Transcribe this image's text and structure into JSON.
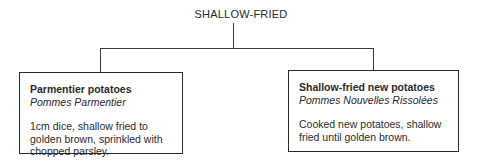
{
  "diagram": {
    "root": {
      "label": "SHALLOW-FRIED"
    },
    "children": [
      {
        "title": "Parmentier potatoes",
        "subtitle": "Pommes Parmentier",
        "description": "1cm dice, shallow fried to golden brown, sprinkled with chopped parsley."
      },
      {
        "title": "Shallow-fried new potatoes",
        "subtitle": "Pommes Nouvelles Rissolées",
        "description": "Cooked new potatoes, shallow fried until golden brown."
      }
    ]
  }
}
